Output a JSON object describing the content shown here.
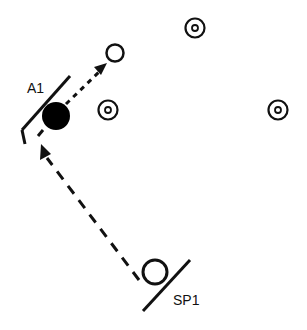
{
  "diagram": {
    "labels": {
      "a1": "A1",
      "sp1": "SP1"
    },
    "colors": {
      "stroke": "#111111",
      "fill": "#000000",
      "background": "#ffffff"
    },
    "elements": {
      "player_a1": {
        "type": "filled-circle",
        "cx": 56,
        "cy": 116,
        "r": 14
      },
      "player_sp1": {
        "type": "open-circle",
        "cx": 155,
        "cy": 272,
        "r": 12
      },
      "open_target": {
        "type": "open-circle",
        "cx": 115,
        "cy": 53,
        "r": 9
      },
      "cone_markers": [
        {
          "cx": 108,
          "cy": 110
        },
        {
          "cx": 195,
          "cy": 28
        },
        {
          "cx": 278,
          "cy": 110
        }
      ],
      "paths": [
        {
          "name": "dashed-run-sp1-to-a1",
          "style": "dashed"
        },
        {
          "name": "dotted-pass-a1-to-target",
          "style": "dotted"
        }
      ]
    }
  }
}
